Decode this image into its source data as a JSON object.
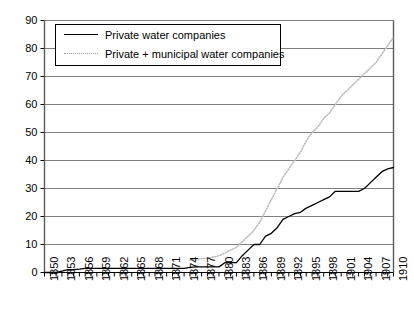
{
  "chart_data": {
    "type": "line",
    "title": "",
    "xlabel": "",
    "ylabel": "",
    "xlim": [
      1850,
      1910
    ],
    "ylim": [
      0,
      90
    ],
    "ytick_labels": [
      "0",
      "10",
      "20",
      "30",
      "40",
      "50",
      "60",
      "70",
      "80",
      "90"
    ],
    "ytick_values": [
      0,
      10,
      20,
      30,
      40,
      50,
      60,
      70,
      80,
      90
    ],
    "xtick_labels": [
      "1850",
      "1853",
      "1856",
      "1859",
      "1862",
      "1865",
      "1868",
      "1871",
      "1874",
      "1877",
      "1880",
      "1883",
      "1886",
      "1889",
      "1892",
      "1895",
      "1898",
      "1901",
      "1904",
      "1907",
      "1910"
    ],
    "xtick_values": [
      1850,
      1853,
      1856,
      1859,
      1862,
      1865,
      1868,
      1871,
      1874,
      1877,
      1880,
      1883,
      1886,
      1889,
      1892,
      1895,
      1898,
      1901,
      1904,
      1907,
      1910
    ],
    "minor_tick_interval": 1,
    "grid": "horizontal",
    "legend_position": "upper-left",
    "series": [
      {
        "name": "Private water companies",
        "style": "solid",
        "color": "#000000",
        "x": [
          1850,
          1851,
          1852,
          1853,
          1854,
          1855,
          1856,
          1857,
          1858,
          1859,
          1860,
          1861,
          1862,
          1863,
          1864,
          1865,
          1866,
          1867,
          1868,
          1869,
          1870,
          1871,
          1872,
          1873,
          1874,
          1875,
          1876,
          1877,
          1878,
          1879,
          1880,
          1881,
          1882,
          1883,
          1884,
          1885,
          1886,
          1887,
          1888,
          1889,
          1890,
          1891,
          1892,
          1893,
          1894,
          1895,
          1896,
          1897,
          1898,
          1899,
          1900,
          1901,
          1902,
          1903,
          1904,
          1905,
          1906,
          1907,
          1908,
          1909,
          1910
        ],
        "values": [
          0,
          0,
          0,
          0.5,
          1,
          1,
          1.2,
          1.5,
          1.5,
          1.5,
          1.5,
          1.5,
          1.5,
          1.5,
          1.5,
          1.5,
          1.5,
          1.5,
          1.5,
          1.5,
          1.5,
          1.5,
          1.5,
          1.5,
          1.5,
          1.8,
          2,
          2,
          2,
          2,
          2,
          3.5,
          3.5,
          3.5,
          6,
          8,
          10,
          10,
          13,
          14,
          16,
          19,
          20,
          21,
          21.5,
          23,
          24,
          25,
          26,
          27,
          29,
          29,
          29,
          29,
          29,
          30,
          32,
          34,
          36,
          37,
          37.5
        ]
      },
      {
        "name": "Private + municipal water companies",
        "style": "dotted",
        "color": "#bdbdbd",
        "x": [
          1875,
          1876,
          1877,
          1878,
          1879,
          1880,
          1881,
          1882,
          1883,
          1884,
          1885,
          1886,
          1887,
          1888,
          1889,
          1890,
          1891,
          1892,
          1893,
          1894,
          1895,
          1896,
          1897,
          1898,
          1899,
          1900,
          1901,
          1902,
          1903,
          1904,
          1905,
          1906,
          1907,
          1908,
          1909,
          1910
        ],
        "values": [
          4.5,
          4.5,
          5,
          5,
          5.5,
          6,
          7,
          8,
          9,
          11,
          13,
          15,
          18,
          22,
          26,
          30,
          34,
          37,
          40,
          43,
          47,
          50,
          52,
          55,
          57,
          60,
          63,
          65,
          67,
          69,
          71,
          73,
          75,
          78,
          81,
          84
        ]
      }
    ]
  },
  "legend": {
    "items": [
      {
        "label": "Private water companies"
      },
      {
        "label": "Private + municipal water companies"
      }
    ]
  }
}
